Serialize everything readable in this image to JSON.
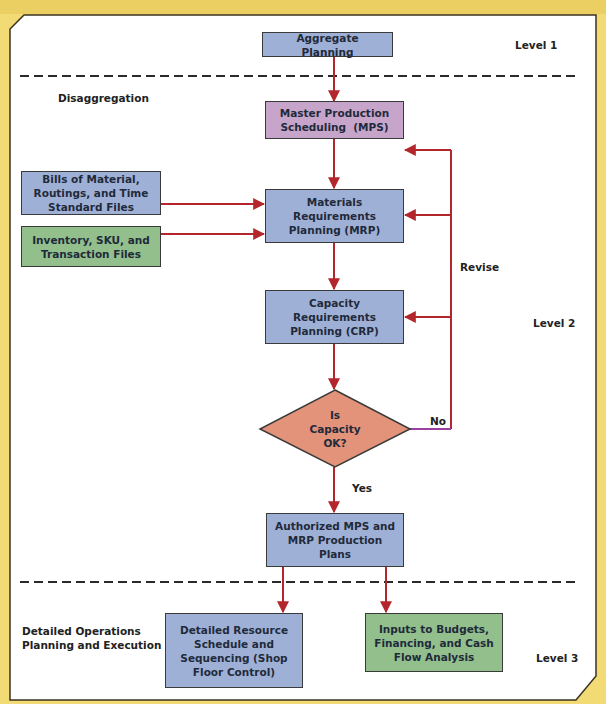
{
  "colors": {
    "background": "#f2da74",
    "panel": "#ffffff",
    "box_blue": "#9fb0d6",
    "box_pink": "#c7a4c9",
    "box_green": "#93bf8d",
    "diamond": "#e3937a",
    "arrow": "#b3262b",
    "no_line": "#9b3fa0"
  },
  "levels": {
    "level1": "Level 1",
    "level2": "Level 2",
    "level3": "Level 3"
  },
  "sections": {
    "disaggregation": "Disaggregation",
    "detailed_ops_line1": "Detailed Operations",
    "detailed_ops_line2": "Planning and Execution"
  },
  "nodes": {
    "aggregate_planning": "Aggregate Planning",
    "mps_line1": "Master Production",
    "mps_line2": "Scheduling  (MPS)",
    "bom_line1": "Bills of Material,",
    "bom_line2": "Routings, and Time",
    "bom_line3": "Standard Files",
    "inventory_line1": "Inventory, SKU, and",
    "inventory_line2": "Transaction Files",
    "mrp_line1": "Materials",
    "mrp_line2": "Requirements",
    "mrp_line3": "Planning (MRP)",
    "crp_line1": "Capacity",
    "crp_line2": "Requirements",
    "crp_line3": "Planning (CRP)",
    "decision_line1": "Is",
    "decision_line2": "Capacity",
    "decision_line3": "OK?",
    "authorized_line1": "Authorized MPS and",
    "authorized_line2": "MRP Production",
    "authorized_line3": "Plans",
    "detailed_line1": "Detailed Resource",
    "detailed_line2": "Schedule and",
    "detailed_line3": "Sequencing (Shop",
    "detailed_line4": "Floor Control)",
    "inputs_line1": "Inputs to Budgets,",
    "inputs_line2": "Financing, and Cash",
    "inputs_line3": "Flow Analysis"
  },
  "edges": {
    "revise": "Revise",
    "no": "No",
    "yes": "Yes"
  }
}
